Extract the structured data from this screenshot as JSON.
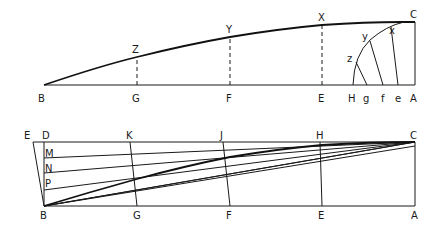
{
  "figure_top": {
    "labels": {
      "B": "B",
      "G": "G",
      "F": "F",
      "E": "E",
      "H": "H",
      "g": "g",
      "f": "f",
      "e": "e",
      "A": "A",
      "C": "C",
      "Z": "Z",
      "Y": "Y",
      "X": "X",
      "z": "z",
      "y": "y",
      "x": "x"
    }
  },
  "figure_bottom": {
    "labels": {
      "E": "E",
      "D": "D",
      "K": "K",
      "J": "J",
      "H": "H",
      "C": "C",
      "M": "M",
      "N": "N",
      "P": "P",
      "B": "B",
      "G": "G",
      "F": "F",
      "E2": "E",
      "A": "A"
    }
  },
  "colors": {
    "ink": "#1a1a1a",
    "background": "#ffffff"
  }
}
